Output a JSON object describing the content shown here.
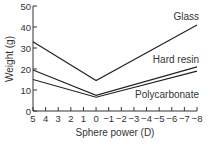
{
  "chart_data": {
    "type": "line",
    "title": "",
    "xlabel": "Sphere power (D)",
    "ylabel": "Weight (g)",
    "x": [
      5,
      0,
      -8
    ],
    "x_ticks": [
      5,
      4,
      3,
      2,
      1,
      0,
      -1,
      -2,
      -3,
      -4,
      -5,
      -6,
      -7,
      -8
    ],
    "x_tick_labels": [
      "5",
      "4",
      "3",
      "2",
      "1",
      "0",
      "−1",
      "−2",
      "−3",
      "−4",
      "−5",
      "−6",
      "−7",
      "−8"
    ],
    "y_ticks": [
      0,
      10,
      20,
      30,
      40,
      50
    ],
    "ylim": [
      0,
      50
    ],
    "xlim": [
      5,
      -8
    ],
    "grid": false,
    "legend_position": "inline labels at right",
    "series": [
      {
        "name": "Glass",
        "values": [
          33,
          14.5,
          41
        ]
      },
      {
        "name": "Hard resin",
        "values": [
          19.5,
          7.5,
          21
        ]
      },
      {
        "name": "Polycarbonate",
        "values": [
          15,
          6.5,
          19
        ]
      }
    ]
  },
  "labels": {
    "glass": "Glass",
    "hard_resin": "Hard resin",
    "polycarbonate": "Polycarbonate",
    "xlabel": "Sphere power (D)",
    "ylabel": "Weight (g)"
  }
}
